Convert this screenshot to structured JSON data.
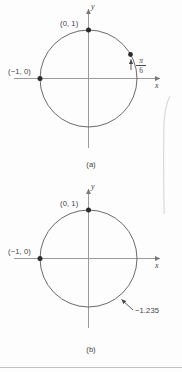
{
  "figure": {
    "page_note": "textbook figure: two unit circles",
    "panels": [
      {
        "id": "a",
        "caption": "(a)",
        "axis_x_label": "x",
        "axis_y_label": "y",
        "points": [
          {
            "name": "top-point",
            "label": "(0, 1)",
            "x": 0,
            "y": 1
          },
          {
            "name": "left-point",
            "label": "(−1, 0)",
            "x": -1,
            "y": 0
          },
          {
            "name": "arc-point",
            "label": "π/6",
            "numerator": "π",
            "denominator": "6"
          }
        ]
      },
      {
        "id": "b",
        "caption": "(b)",
        "axis_x_label": "x",
        "axis_y_label": "y",
        "points": [
          {
            "name": "top-point",
            "label": "(0, 1)",
            "x": 0,
            "y": 1
          },
          {
            "name": "left-point",
            "label": "(−1, 0)",
            "x": -1,
            "y": 0
          },
          {
            "name": "arc-point",
            "label": "−1.235",
            "value": -1.235
          }
        ]
      }
    ],
    "colors": {
      "ink": "#3f3f3f",
      "curve": "#555555",
      "axis": "#8d8d8d",
      "rule": "#b9b9b9"
    }
  }
}
